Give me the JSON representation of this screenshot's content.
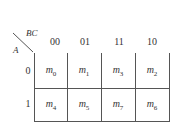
{
  "kmap": {
    "col_var": "BC",
    "row_var": "A",
    "col_headers": [
      "00",
      "01",
      "11",
      "10"
    ],
    "row_headers": [
      "0",
      "1"
    ],
    "cells": [
      [
        {
          "base": "m",
          "sub": "0"
        },
        {
          "base": "m",
          "sub": "1"
        },
        {
          "base": "m",
          "sub": "3"
        },
        {
          "base": "m",
          "sub": "2"
        }
      ],
      [
        {
          "base": "m",
          "sub": "4"
        },
        {
          "base": "m",
          "sub": "5"
        },
        {
          "base": "m",
          "sub": "7"
        },
        {
          "base": "m",
          "sub": "6"
        }
      ]
    ]
  }
}
